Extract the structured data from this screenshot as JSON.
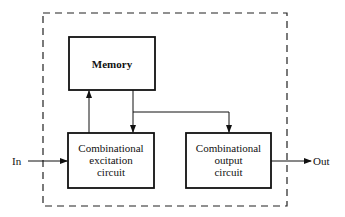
{
  "diagram": {
    "memory": {
      "label": "Memory"
    },
    "excitation": {
      "line1": "Combinational",
      "line2": "excitation",
      "line3": "circuit"
    },
    "output": {
      "line1": "Combinational",
      "line2": "output",
      "line3": "circuit"
    },
    "input_label": "In",
    "output_label": "Out"
  }
}
